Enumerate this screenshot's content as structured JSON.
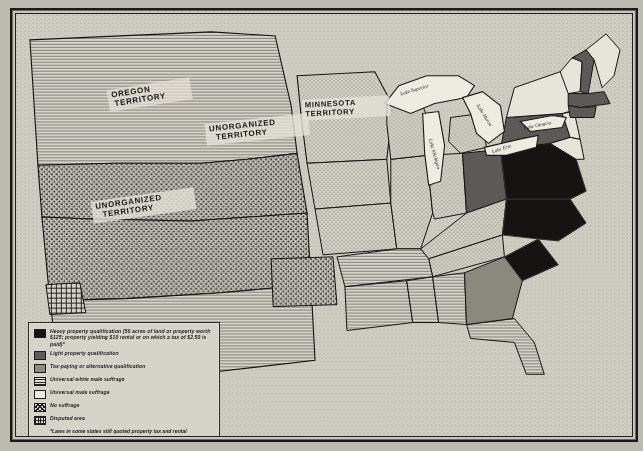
{
  "document": {
    "kind": "historical-map",
    "subject": "Suffrage qualifications in the United States, c. 1850"
  },
  "map": {
    "territory_labels": [
      {
        "id": "oregon",
        "text_line1": "OREGON",
        "text_line2": "TERRITORY"
      },
      {
        "id": "unorganized-north",
        "text_line1": "UNORGANIZED",
        "text_line2": "TERRITORY"
      },
      {
        "id": "unorganized-south",
        "text_line1": "UNORGANIZED",
        "text_line2": "TERRITORY"
      },
      {
        "id": "minnesota",
        "text_line1": "MINNESOTA",
        "text_line2": "TERRITORY"
      }
    ],
    "water_labels": [
      {
        "id": "lake-superior",
        "text": "Lake Superior"
      },
      {
        "id": "lake-michigan",
        "text": "Lake Michigan"
      },
      {
        "id": "lake-huron",
        "text": "Lake Huron"
      },
      {
        "id": "lake-erie",
        "text": "Lake Erie"
      },
      {
        "id": "lake-ontario",
        "text": "Lake Ontario"
      }
    ]
  },
  "legend": {
    "items": [
      {
        "key": "heavy",
        "swatch": "solid-black",
        "color": "#151413",
        "label": "Heavy property qualification (50 acres of land or property worth $125; property yielding $10 rental or on which a tax of $2.50 is paid)*"
      },
      {
        "key": "light",
        "swatch": "solid-dark-gray",
        "color": "#5d5b57",
        "label": "Light property qualification"
      },
      {
        "key": "tax",
        "swatch": "solid-medium-gray",
        "color": "#8e8b84",
        "label": "Tax-paying or alternative qualification"
      },
      {
        "key": "universal-white-male",
        "swatch": "horizontal-hatch",
        "color": "#e6e3da",
        "label": "Universal white male suffrage"
      },
      {
        "key": "universal-male",
        "swatch": "plain-white",
        "color": "#eeebe2",
        "label": "Universal male suffrage"
      },
      {
        "key": "no-suffrage",
        "swatch": "crosshatch",
        "color": "#ddd9d0",
        "label": "No suffrage"
      },
      {
        "key": "disputed",
        "swatch": "grid",
        "color": "#e2dfd6",
        "label": "Disputed area"
      }
    ],
    "footnote": "*Laws in some states still quoted property tax and rental requirements in terms of pounds and shillings."
  }
}
